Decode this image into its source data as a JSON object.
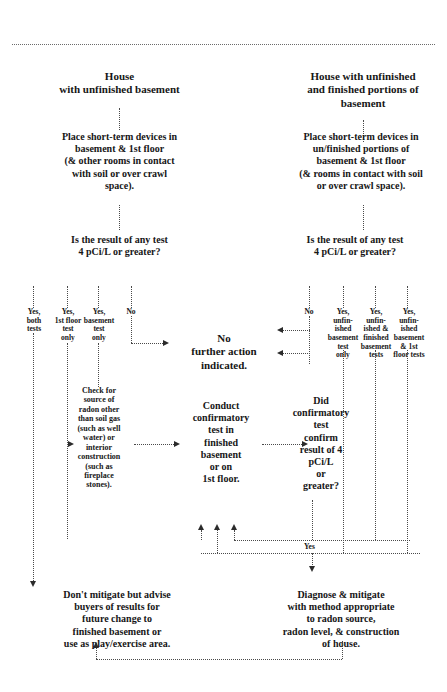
{
  "divider": {
    "name": "top-dotted-rule"
  },
  "branches": {
    "left": {
      "header": "House\nwith unfinished basement",
      "step_place": "Place short-term devices in\nbasement & 1st floor\n(& other rooms in contact\nwith soil or over crawl\nspace).",
      "decision": "Is the result of any test\n4 pCi/L or greater?",
      "outcomes": [
        "Yes,\nboth\ntests",
        "Yes,\n1st floor\ntest\nonly",
        "Yes,\nbasement\ntest\nonly",
        "No"
      ],
      "check_source": "Check for\nsource of\nradon other\nthan soil gas\n(such as well\nwater) or\ninterior\nconstruction\n(such as\nfireplace\nstones).",
      "final": "Don't mitigate but advise\nbuyers of results for\nfuture change to\nfinished basement or\nuse as play/exercise area."
    },
    "right": {
      "header": "House with unfinished\nand finished portions of\nbasement",
      "step_place": "Place short-term devices in\nun/finished portions of\nbasement & 1st floor\n(& rooms in contact with soil\nor over crawl space).",
      "decision": "Is the result of any test\n4 pCi/L or greater?",
      "outcomes": [
        "No",
        "Yes,\nunfin-\nished\nbasement\ntest\nonly",
        "Yes,\nunfin-\nished &\nfinished\nbasement\ntests",
        "Yes,\nunfin-\nished\nbasement\n& 1st\nfloor tests"
      ],
      "final": "Diagnose & mitigate\nwith method appropriate\nto radon source,\nradon level, & construction\nof house."
    }
  },
  "center": {
    "no_action": "No\nfurther action\nindicated.",
    "conduct_test": "Conduct\nconfirmatory\ntest in\nfinished\nbasement\nor on\n1st floor.",
    "confirm_decision": "Did\nconfirmatory\ntest\nconfirm\nresult of 4\npCi/L\nor\ngreater?",
    "yes_label": "Yes"
  },
  "colors": {
    "line": "#4a4a4a",
    "text": "#161616",
    "arrow": "#2b2b2b",
    "background": "#ffffff"
  }
}
